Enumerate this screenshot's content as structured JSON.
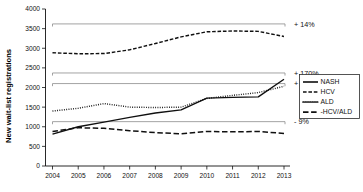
{
  "chart_data": {
    "type": "line",
    "title": "",
    "xlabel": "",
    "ylabel": "New wait-list registrations",
    "x": [
      2004,
      2005,
      2006,
      2007,
      2008,
      2009,
      2010,
      2011,
      2012,
      2013
    ],
    "xtick_labels": [
      "2004",
      "2005",
      "2006",
      "2007",
      "2008",
      "2009",
      "2010",
      "2011",
      "2012",
      "2013"
    ],
    "ylim": [
      0,
      4000
    ],
    "ytick_values": [
      0,
      500,
      1000,
      1500,
      2000,
      2500,
      3000,
      3500,
      4000
    ],
    "ytick_labels": [
      "0",
      "500",
      "1000",
      "1500",
      "2000",
      "2500",
      "3000",
      "3500",
      "4000"
    ],
    "grid": false,
    "legend_position": "right",
    "series": [
      {
        "name": "NASH",
        "style": "solid",
        "values": [
          810,
          1000,
          1120,
          1240,
          1350,
          1430,
          1730,
          1750,
          1760,
          2210
        ]
      },
      {
        "name": "HCV",
        "style": "dashed",
        "values": [
          2885,
          2860,
          2865,
          2960,
          3120,
          3290,
          3420,
          3440,
          3430,
          3300
        ]
      },
      {
        "name": "ALD",
        "style": "dotted",
        "values": [
          1400,
          1470,
          1590,
          1500,
          1490,
          1500,
          1720,
          1800,
          1870,
          2030
        ]
      },
      {
        "name": "-HCV/ALD",
        "style": "longdash",
        "values": [
          880,
          975,
          960,
          900,
          850,
          820,
          880,
          870,
          880,
          830
        ]
      }
    ],
    "annotations": [
      {
        "label": "+ 14%",
        "value": 3620,
        "series": "HCV"
      },
      {
        "label": "+ 170%",
        "value": 2370,
        "series": "NASH"
      },
      {
        "label": "+ 45%",
        "value": 2100,
        "series": "ALD"
      },
      {
        "label": "- 9%",
        "value": 1130,
        "series": "-HCV/ALD"
      }
    ]
  },
  "legend": {
    "items": [
      {
        "label": "NASH"
      },
      {
        "label": "HCV"
      },
      {
        "label": "ALD"
      },
      {
        "label": "-HCV/ALD"
      }
    ]
  },
  "colors": {
    "line": "#101010",
    "reference": "#8c8c8c",
    "axis": "#111111",
    "background": "#ffffff"
  }
}
